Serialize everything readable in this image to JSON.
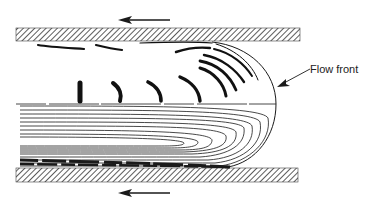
{
  "diagram": {
    "labels": {
      "flow_front": "Flow front"
    },
    "elements": {
      "top_wall": "hatched mold wall (top)",
      "bottom_wall": "hatched mold wall (bottom)",
      "top_arrow": "arrow pointing left (wall motion)",
      "bottom_arrow": "arrow pointing left (wall motion)",
      "streamlines": "fountain-flow streamlines curving from core toward walls",
      "flow_front_curve": "semicircular advancing front"
    },
    "colors": {
      "ink": "#1a1a1a",
      "background": "#ffffff"
    }
  }
}
